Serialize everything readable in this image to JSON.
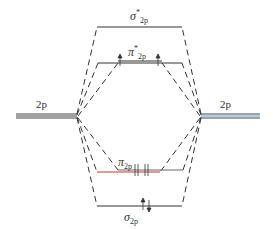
{
  "diagram": {
    "atomic_orbitals": {
      "left": {
        "label": "2p",
        "line_count": 3
      },
      "right": {
        "label": "2p",
        "line_count": 3
      }
    },
    "molecular_orbitals": [
      {
        "id": "sigma_star_2p",
        "symbol": "σ",
        "superscript": "*",
        "subscript": "2p",
        "electrons": 0
      },
      {
        "id": "pi_star_2p",
        "symbol": "π",
        "superscript": "*",
        "subscript": "2p",
        "electrons": 2,
        "degeneracy": 2,
        "spins": [
          "up",
          "up"
        ]
      },
      {
        "id": "pi_2p",
        "symbol": "π",
        "superscript": "",
        "subscript": "2p",
        "electrons": 4,
        "degeneracy": 2,
        "spins": [
          "up-down",
          "up-down"
        ]
      },
      {
        "id": "sigma_2p",
        "symbol": "σ",
        "superscript": "",
        "subscript": "2p",
        "electrons": 2,
        "spins": [
          "up-down"
        ]
      }
    ],
    "colors": {
      "line": "#333333",
      "pi_highlight": "#c0392b",
      "ao_right_tint": "#5b9bd5"
    }
  }
}
